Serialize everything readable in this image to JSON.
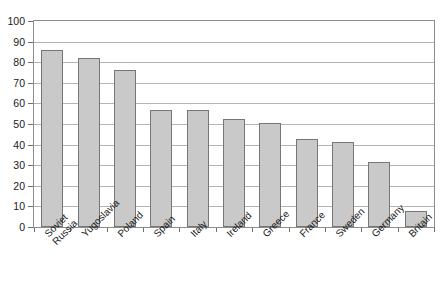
{
  "chart_data": {
    "type": "bar",
    "title": "",
    "subtitle": "",
    "xlabel": "",
    "ylabel": "",
    "ylim": [
      0,
      100
    ],
    "ytick_step": 10,
    "yticks": [
      100,
      90,
      80,
      70,
      60,
      50,
      40,
      30,
      20,
      10,
      0
    ],
    "grid": true,
    "legend": false,
    "legend_position": "none",
    "categories": [
      "Soviet Russia",
      "Yugoslavia",
      "Poland",
      "Spain",
      "Italy",
      "Ireland",
      "Greece",
      "France",
      "Sweden",
      "Germany",
      "Britain"
    ],
    "category_lines": [
      [
        "Soviet",
        "Russia"
      ],
      [
        "Yugoslavia"
      ],
      [
        "Poland"
      ],
      [
        "Spain"
      ],
      [
        "Italy"
      ],
      [
        "Ireland"
      ],
      [
        "Greece"
      ],
      [
        "France"
      ],
      [
        "Sweden"
      ],
      [
        "Germany"
      ],
      [
        "Britain"
      ]
    ],
    "values": [
      86,
      82,
      76,
      57,
      57,
      52.5,
      50.5,
      42.5,
      41.5,
      31.5,
      8
    ],
    "colors": {
      "bar_fill": "#c9c9c9",
      "bar_border": "#767676",
      "gridline": "#b4b4b4",
      "frame": "#8c8c8c",
      "background": "#ffffff",
      "text": "#1a1a1a"
    }
  }
}
